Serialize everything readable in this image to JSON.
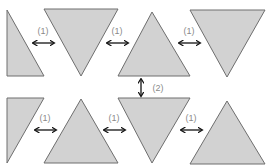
{
  "diagram": {
    "title": "",
    "colors": {
      "fill": "#d2d2d2",
      "stroke": "#6e6e6e",
      "arrow": "#111111",
      "label": "#8a8a8a",
      "background": "#ffffff"
    },
    "triangles": [
      {
        "id": "t1",
        "row": "top",
        "orientation": "right-angle-partial",
        "points": "7,10 7,76 44,76"
      },
      {
        "id": "t2",
        "row": "top",
        "orientation": "down",
        "points": "44,9 118,9 81,76"
      },
      {
        "id": "t3",
        "row": "top",
        "orientation": "up",
        "points": "152,12 190,76 118,76"
      },
      {
        "id": "t4",
        "row": "top",
        "orientation": "down",
        "points": "190,10 265,10 227,77"
      },
      {
        "id": "t5",
        "row": "bottom",
        "orientation": "right-angle-partial",
        "points": "7,98 44,98 7,163"
      },
      {
        "id": "t6",
        "row": "bottom",
        "orientation": "up",
        "points": "81,99 118,163 44,163"
      },
      {
        "id": "t7",
        "row": "bottom",
        "orientation": "down",
        "points": "118,98 190,98 152,163"
      },
      {
        "id": "t8",
        "row": "bottom",
        "orientation": "up",
        "points": "227,101 265,164 190,164"
      }
    ],
    "horizontal_arrows": [
      {
        "id": "a1",
        "label": "(1)",
        "x1": 32,
        "x2": 55,
        "y": 43,
        "lx": 43,
        "ly": 34
      },
      {
        "id": "a2",
        "label": "(1)",
        "x1": 106,
        "x2": 129,
        "y": 43,
        "lx": 117,
        "ly": 34
      },
      {
        "id": "a3",
        "label": "(1)",
        "x1": 178,
        "x2": 201,
        "y": 43,
        "lx": 189,
        "ly": 34
      },
      {
        "id": "a4",
        "label": "(1)",
        "x1": 34,
        "x2": 57,
        "y": 130,
        "lx": 45,
        "ly": 121
      },
      {
        "id": "a5",
        "label": "(1)",
        "x1": 103,
        "x2": 126,
        "y": 130,
        "lx": 114,
        "ly": 121
      },
      {
        "id": "a6",
        "label": "(1)",
        "x1": 180,
        "x2": 203,
        "y": 130,
        "lx": 191,
        "ly": 121
      }
    ],
    "vertical_arrows": [
      {
        "id": "v1",
        "label": "(2)",
        "x": 141,
        "y1": 78,
        "y2": 97,
        "lx": 158,
        "ly": 91
      }
    ]
  }
}
